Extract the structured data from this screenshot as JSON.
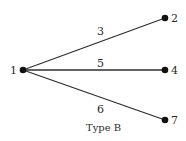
{
  "diagram": {
    "caption": "Type B",
    "nodes": [
      {
        "id": "1",
        "label": "1",
        "x": 23,
        "y": 70
      },
      {
        "id": "2",
        "label": "2",
        "x": 165,
        "y": 18
      },
      {
        "id": "4",
        "label": "4",
        "x": 165,
        "y": 70
      },
      {
        "id": "7",
        "label": "7",
        "x": 165,
        "y": 120
      }
    ],
    "edges": [
      {
        "from": "1",
        "to": "2",
        "label": "3"
      },
      {
        "from": "1",
        "to": "4",
        "label": "5"
      },
      {
        "from": "1",
        "to": "7",
        "label": "6"
      }
    ],
    "colors": {
      "node": "#111111",
      "edge": "#2e2e2e",
      "text": "#2a2a2a"
    }
  }
}
